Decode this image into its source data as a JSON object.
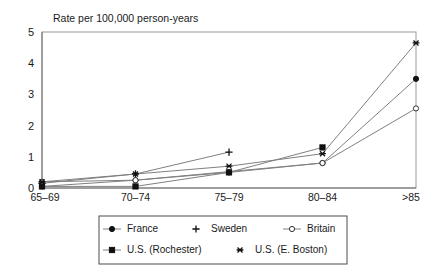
{
  "chart_data": {
    "type": "line",
    "title": "Rate per 100,000 person-years",
    "xlabel": "",
    "ylabel": "",
    "ylim": [
      0,
      5
    ],
    "yticks": [
      0,
      1,
      2,
      3,
      4,
      5
    ],
    "grid": false,
    "legend_position": "bottom",
    "categories": [
      "65–69",
      "70–74",
      "75–79",
      "80–84",
      ">85"
    ],
    "series": [
      {
        "name": "France",
        "marker": "filled-circle",
        "values": [
          0.05,
          0.25,
          0.5,
          0.8,
          3.5
        ]
      },
      {
        "name": "Sweden",
        "marker": "plus",
        "values": [
          0.15,
          0.45,
          1.15,
          null,
          null
        ]
      },
      {
        "name": "Britain",
        "marker": "open-circle",
        "values": [
          0.2,
          0.25,
          null,
          0.8,
          2.55
        ]
      },
      {
        "name": "U.S. (Rochester)",
        "marker": "filled-square",
        "values": [
          0.05,
          0.05,
          0.5,
          1.3,
          null
        ]
      },
      {
        "name": "U.S. (E. Boston)",
        "marker": "asterisk",
        "values": [
          0.2,
          0.45,
          0.7,
          1.1,
          4.65
        ]
      }
    ]
  },
  "colors": {
    "line": "#808080",
    "marker": "#111111",
    "axis": "#6e6e6e",
    "plot_border": "#9a9a9a",
    "legend_border": "#4d4d4d",
    "background": "#ffffff",
    "text": "#1a1a1a"
  },
  "axis": {
    "y_tick_labels": [
      "0",
      "1",
      "2",
      "3",
      "4",
      "5"
    ],
    "x_tick_labels": [
      "65–69",
      "70–74",
      "75–79",
      "80–84",
      ">85"
    ]
  },
  "legend": {
    "row1": [
      "France",
      "Sweden",
      "Britain"
    ],
    "row2": [
      "U.S. (Rochester)",
      "U.S. (E. Boston)"
    ]
  }
}
